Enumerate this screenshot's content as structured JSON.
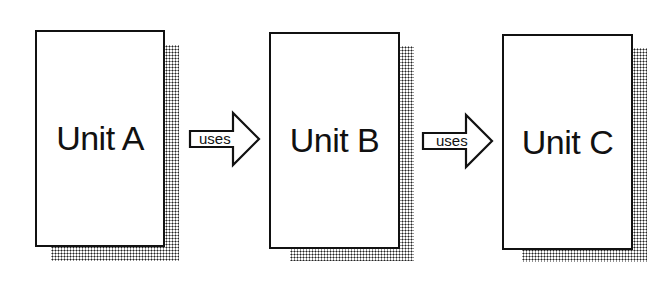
{
  "units": [
    {
      "label": "Unit A"
    },
    {
      "label": "Unit B"
    },
    {
      "label": "Unit C"
    }
  ],
  "arrows": [
    {
      "label": "uses",
      "from": "Unit A",
      "to": "Unit B"
    },
    {
      "label": "uses",
      "from": "Unit B",
      "to": "Unit C"
    }
  ]
}
